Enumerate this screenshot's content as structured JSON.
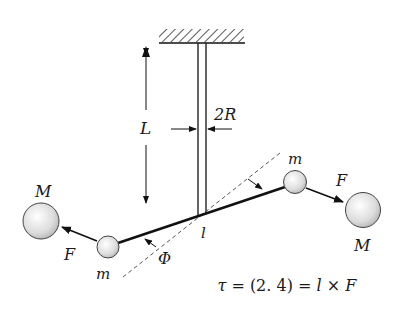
{
  "diagram": {
    "type": "torsion-balance (Cavendish experiment)",
    "labels": {
      "length": "L",
      "fiber_diameter": "2R",
      "small_mass_left": "m",
      "small_mass_right": "m",
      "large_mass_left": "M",
      "large_mass_right": "M",
      "force_left": "F",
      "force_right": "F",
      "lever_arm": "l",
      "angle": "Φ"
    },
    "equation": {
      "tau": "τ",
      "eq1": " = (2. 4) = ",
      "l": "l",
      "times": " × ",
      "F": "F"
    },
    "colors": {
      "line": "#111111",
      "dashed": "#555555",
      "ball_fill": "#e6e6e6",
      "ball_stroke": "#444444"
    }
  }
}
